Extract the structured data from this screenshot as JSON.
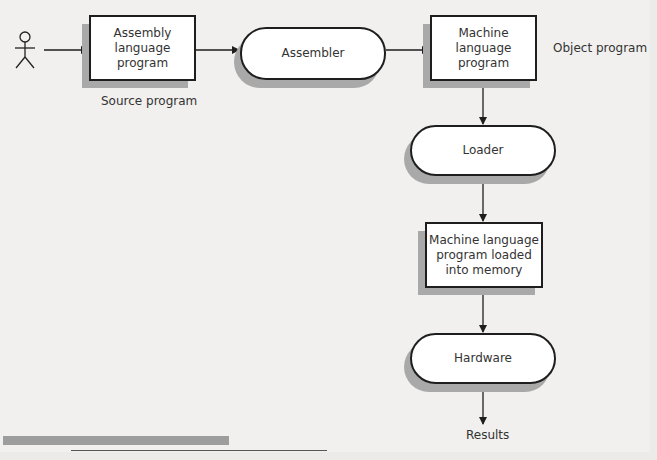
{
  "diagram": {
    "type": "flowchart",
    "title": "",
    "actor": {
      "icon": "stick-figure-icon"
    },
    "nodes": [
      {
        "id": "assembly",
        "shape": "rectangle",
        "text": "Assembly language program",
        "lines": [
          "Assembly",
          "language",
          "program"
        ]
      },
      {
        "id": "assembler",
        "shape": "pill",
        "text": "Assembler",
        "lines": [
          "Assembler"
        ]
      },
      {
        "id": "machine",
        "shape": "rectangle",
        "text": "Machine language program",
        "lines": [
          "Machine",
          "language",
          "program"
        ]
      },
      {
        "id": "loader",
        "shape": "pill",
        "text": "Loader",
        "lines": [
          "Loader"
        ]
      },
      {
        "id": "loaded",
        "shape": "rectangle",
        "text": "Machine language program loaded into memory",
        "lines": [
          "Machine language",
          "program loaded",
          "into memory"
        ]
      },
      {
        "id": "hardware",
        "shape": "pill",
        "text": "Hardware",
        "lines": [
          "Hardware"
        ]
      }
    ],
    "annotations": {
      "source": "Source program",
      "object": "Object program",
      "results": "Results"
    },
    "edges": [
      {
        "from": "actor",
        "to": "assembly"
      },
      {
        "from": "assembly",
        "to": "assembler"
      },
      {
        "from": "assembler",
        "to": "machine"
      },
      {
        "from": "machine",
        "to": "loader"
      },
      {
        "from": "loader",
        "to": "loaded"
      },
      {
        "from": "loaded",
        "to": "hardware"
      },
      {
        "from": "hardware",
        "to": "results"
      }
    ]
  }
}
